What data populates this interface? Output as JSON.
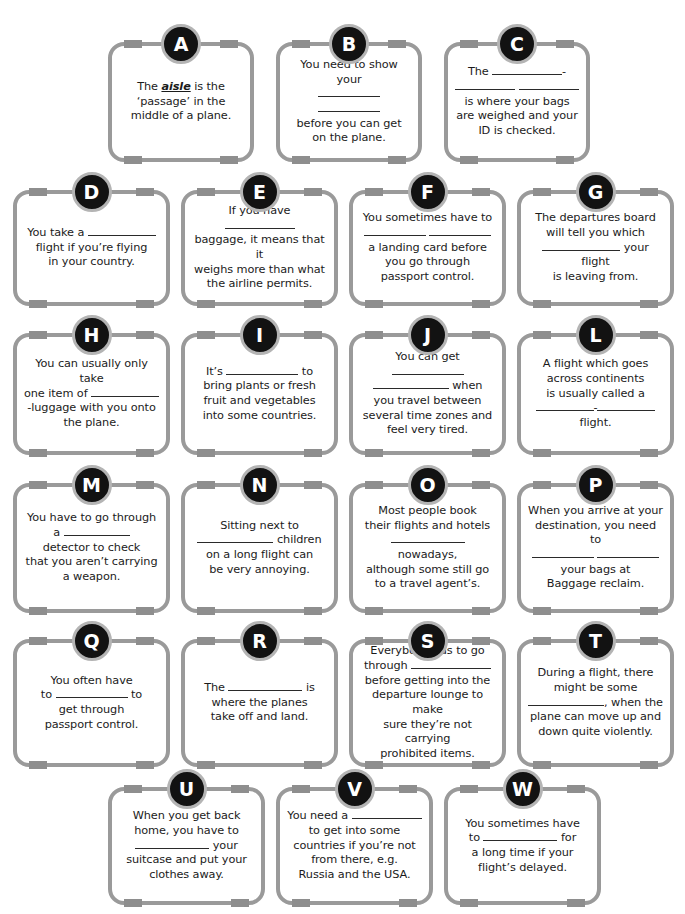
{
  "worksheet": {
    "title": "Airport and flying vocabulary gap-fill cards",
    "accent_color": "#121212",
    "border_color": "#9a9a9a",
    "tab_color": "#8e8e8e",
    "badge_ring_color": "#b4b4b4",
    "text_color": "#1b1b1b"
  },
  "cards": [
    {
      "letter": "A",
      "row": 1,
      "html": "The <u>aisle</u> is the<br>&lsquo;passage&rsquo; in the<br>middle of a plane.",
      "plain": "The aisle is the 'passage' in the middle of a plane.",
      "blanks": 0
    },
    {
      "letter": "B",
      "row": 1,
      "html": "You need to show your<br><span class=\"blank\" style=\"width:62px\"></span> <span class=\"blank\" style=\"width:62px\"></span><br>before you can get<br>on the plane.",
      "plain": "You need to show your ______ ______ before you can get on the plane.",
      "blanks": 2
    },
    {
      "letter": "C",
      "row": 1,
      "html": "The <span class=\"blank\" style=\"width:70px\"></span>-<br><span class=\"blank\" style=\"width:60px\"></span> <span class=\"blank\" style=\"width:60px\"></span><br>is where your bags<br>are weighed and your<br>ID is checked.",
      "plain": "The ______-______ ______ is where your bags are weighed and your ID is checked.",
      "blanks": 3
    },
    {
      "letter": "D",
      "row": 2,
      "html": "You take a <span class=\"blank\" style=\"width:68px\"></span><br>flight if you&rsquo;re flying<br>in your country.",
      "plain": "You take a ______ flight if you're flying in your country.",
      "blanks": 1
    },
    {
      "letter": "E",
      "row": 2,
      "html": "If you have <span class=\"blank\" style=\"width:70px\"></span><br>baggage, it means that it<br>weighs more than what<br>the airline permits.",
      "plain": "If you have ______ baggage, it means that it weighs more than what the airline permits.",
      "blanks": 1
    },
    {
      "letter": "F",
      "row": 2,
      "html": "You sometimes have to<br><span class=\"blank\" style=\"width:62px\"></span> <span class=\"blank\" style=\"width:62px\"></span><br>a landing card before<br>you go through<br>passport control.",
      "plain": "You sometimes have to ______ ______ a landing card before you go through passport control.",
      "blanks": 2
    },
    {
      "letter": "G",
      "row": 2,
      "html": "The departures board<br>will tell you which<br><span class=\"blank\" style=\"width:78px\"></span> your flight<br>is leaving from.",
      "plain": "The departures board will tell you which ______ your flight is leaving from.",
      "blanks": 1
    },
    {
      "letter": "H",
      "row": 3,
      "html": "You can usually only take<br>one item of <span class=\"blank\" style=\"width:68px\"></span><br>-luggage with you onto<br>the plane.",
      "plain": "You can usually only take one item of ______-luggage with you onto the plane.",
      "blanks": 1
    },
    {
      "letter": "I",
      "row": 3,
      "html": "It&rsquo;s <span class=\"blank\" style=\"width:72px\"></span> to<br>bring plants or fresh<br>fruit and vegetables<br>into some countries.",
      "plain": "It's ______ to bring plants or fresh fruit and vegetables into some countries.",
      "blanks": 1
    },
    {
      "letter": "J",
      "row": 3,
      "html": "You can get <span class=\"blank\" style=\"width:72px\"></span><br><span class=\"blank\" style=\"width:76px\"></span> when<br>you travel between<br>several time zones and<br>feel very tired.",
      "plain": "You can get ______ ______ when you travel between several time zones and feel very tired.",
      "blanks": 2
    },
    {
      "letter": "L",
      "row": 3,
      "html": "A flight which goes<br>across continents<br>is usually called a<br><span class=\"blank\" style=\"width:58px\"></span>-<span class=\"blank\" style=\"width:58px\"></span><br>flight.",
      "plain": "A flight which goes across continents is usually called a ______-______ flight.",
      "blanks": 2
    },
    {
      "letter": "M",
      "row": 4,
      "html": "You have to go through<br>a <span class=\"blank\" style=\"width:66px\"></span><br>detector to check<br>that you aren&rsquo;t carrying<br>a weapon.",
      "plain": "You have to go through a ______ detector to check that you aren't carrying a weapon.",
      "blanks": 1
    },
    {
      "letter": "N",
      "row": 4,
      "html": "Sitting next to<br><span class=\"blank\" style=\"width:76px\"></span> children<br>on a long flight can<br>be very annoying.",
      "plain": "Sitting next to ______ children on a long flight can be very annoying.",
      "blanks": 1
    },
    {
      "letter": "O",
      "row": 4,
      "html": "Most people book<br>their flights and hotels<br><span class=\"blank\" style=\"width:74px\"></span> nowadays,<br>although some still go<br>to a travel agent&rsquo;s.",
      "plain": "Most people book their flights and hotels ______ nowadays, although some still go to a travel agent's.",
      "blanks": 1
    },
    {
      "letter": "P",
      "row": 4,
      "html": "When you arrive at your<br>destination, you need to<br><span class=\"blank\" style=\"width:62px\"></span> <span class=\"blank\" style=\"width:62px\"></span><br>your bags at<br>Baggage reclaim.",
      "plain": "When you arrive at your destination, you need to ______ ______ your bags at Baggage reclaim.",
      "blanks": 2
    },
    {
      "letter": "Q",
      "row": 5,
      "html": "You often have<br>to <span class=\"blank\" style=\"width:72px\"></span> to<br>get through<br>passport control.",
      "plain": "You often have to ______ to get through passport control.",
      "blanks": 1
    },
    {
      "letter": "R",
      "row": 5,
      "html": "The <span class=\"blank\" style=\"width:74px\"></span> is<br>where the planes<br>take off and land.",
      "plain": "The ______ is where the planes take off and land.",
      "blanks": 1
    },
    {
      "letter": "S",
      "row": 5,
      "html": "Everybody has to go<br>through <span class=\"blank\" style=\"width:80px\"></span><br>before getting into the<br>departure lounge to make<br>sure they&rsquo;re not carrying<br>prohibited items.",
      "plain": "Everybody has to go through ______ before getting into the departure lounge to make sure they're not carrying prohibited items.",
      "blanks": 1
    },
    {
      "letter": "T",
      "row": 5,
      "html": "During a flight, there<br>might be some<br><span class=\"blank\" style=\"width:76px\"></span>, when the<br>plane can move up and<br>down quite violently.",
      "plain": "During a flight, there might be some ______, when the plane can move up and down quite violently.",
      "blanks": 1
    },
    {
      "letter": "U",
      "row": 6,
      "html": "When you get back<br>home, you have to<br><span class=\"blank\" style=\"width:74px\"></span> your<br>suitcase and put your<br>clothes away.",
      "plain": "When you get back home, you have to ______ your suitcase and put your clothes away.",
      "blanks": 1
    },
    {
      "letter": "V",
      "row": 6,
      "html": "You need a <span class=\"blank\" style=\"width:70px\"></span><br>to get into some<br>countries if you&rsquo;re not<br>from there, e.g.<br>Russia and the USA.",
      "plain": "You need a ______ to get into some countries if you're not from there, e.g. Russia and the USA.",
      "blanks": 1
    },
    {
      "letter": "W",
      "row": 6,
      "html": "You sometimes have<br>to <span class=\"blank\" style=\"width:74px\"></span> for<br>a long time if your<br>flight&rsquo;s delayed.",
      "plain": "You sometimes have to ______ for a long time if your flight's delayed.",
      "blanks": 1
    }
  ],
  "layout": {
    "rows": [
      {
        "index": 1,
        "count": 3,
        "left": 108,
        "top": 42,
        "card_w": 146,
        "card_h": 120,
        "gap": 22
      },
      {
        "index": 2,
        "count": 4,
        "left": 13,
        "top": 190,
        "card_w": 157,
        "card_h": 116,
        "gap": 11
      },
      {
        "index": 3,
        "count": 4,
        "left": 13,
        "top": 333,
        "card_w": 157,
        "card_h": 122,
        "gap": 11
      },
      {
        "index": 4,
        "count": 4,
        "left": 13,
        "top": 483,
        "card_w": 157,
        "card_h": 130,
        "gap": 11
      },
      {
        "index": 5,
        "count": 4,
        "left": 13,
        "top": 639,
        "card_w": 157,
        "card_h": 128,
        "gap": 11
      },
      {
        "index": 6,
        "count": 3,
        "left": 108,
        "top": 787,
        "card_w": 157,
        "card_h": 118,
        "gap": 11
      }
    ]
  }
}
